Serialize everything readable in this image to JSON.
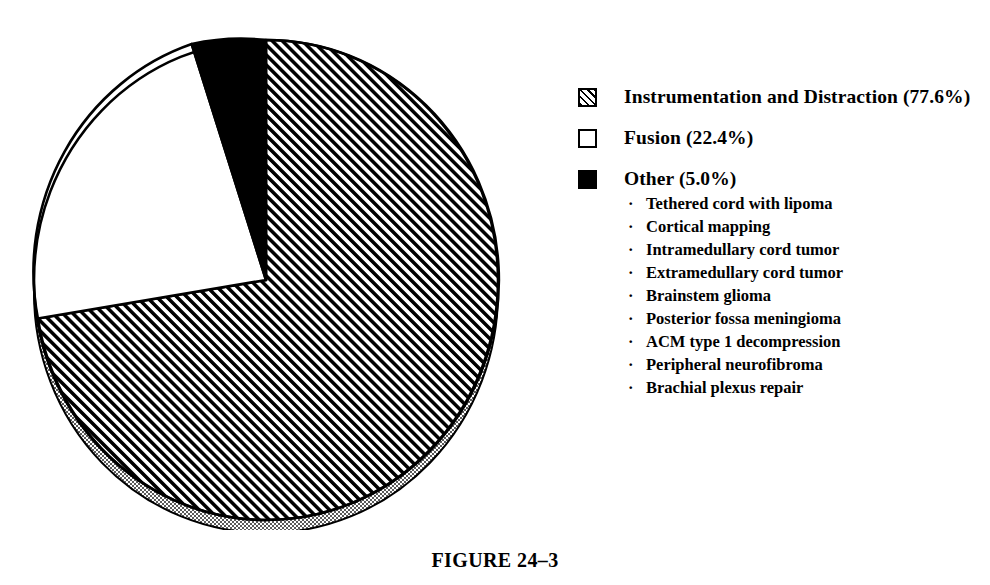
{
  "figure": {
    "caption": "FIGURE 24–3"
  },
  "legend": {
    "items": [
      {
        "swatch": "hatched",
        "label": "Instrumentation and Distraction (77.6%)",
        "name": "Instrumentation and Distraction",
        "percent": 77.6
      },
      {
        "swatch": "white",
        "label": "Fusion (22.4%)",
        "name": "Fusion",
        "percent": 22.4
      },
      {
        "swatch": "black",
        "label": "Other (5.0%)",
        "name": "Other",
        "percent": 5.0
      }
    ],
    "other_sublist": [
      "Tethered cord with lipoma",
      "Cortical mapping",
      "Intramedullary cord tumor",
      "Extramedullary cord tumor",
      "Brainstem glioma",
      "Posterior fossa meningioma",
      "ACM type 1 decompression",
      "Peripheral neurofibroma",
      "Brachial plexus repair"
    ],
    "bullet_glyph": "·"
  },
  "colors": {
    "ink": "#000000",
    "paper": "#ffffff",
    "shadow_rim": "#9a9a9a"
  },
  "chart_data": {
    "type": "pie",
    "title": "FIGURE 24–3",
    "categories": [
      "Instrumentation and Distraction",
      "Fusion",
      "Other"
    ],
    "values": [
      77.6,
      22.4,
      5.0
    ],
    "labels": [
      "Instrumentation and Distraction (77.6%)",
      "Fusion (22.4%)",
      "Other (5.0%)"
    ],
    "fills": [
      "hatched-45deg",
      "white",
      "solid-black"
    ],
    "start_angle_deg": 0,
    "direction": "clockwise",
    "slice_angles_deg": [
      279.4,
      62.6,
      18.0
    ],
    "legend_position": "right",
    "grid": false,
    "three_d_base": true
  }
}
